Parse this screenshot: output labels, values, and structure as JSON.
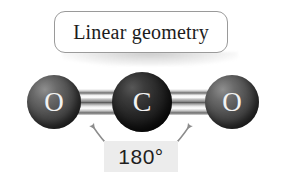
{
  "figure": {
    "title_label": "Linear geometry",
    "angle_label": "180°",
    "background_color": "#ffffff"
  },
  "callout": {
    "text": "Linear geometry",
    "border_color": "#9a9a9a",
    "fill_color": "#ffffff"
  },
  "molecule": {
    "name": "carbon-dioxide",
    "geometry": "linear",
    "bond_angle": "180°",
    "atoms": [
      {
        "symbol": "O",
        "role": "oxygen-left",
        "color": "#3a3a3a",
        "label_color": "#f2f2f2"
      },
      {
        "symbol": "C",
        "role": "carbon-center",
        "color": "#1a1a1a",
        "label_color": "#f2f2f2"
      },
      {
        "symbol": "O",
        "role": "oxygen-right",
        "color": "#3a3a3a",
        "label_color": "#f2f2f2"
      }
    ],
    "bonds": [
      {
        "name": "bond-left",
        "order": "double"
      },
      {
        "name": "bond-right",
        "order": "double"
      }
    ]
  },
  "annotation": {
    "angle_value": "180°",
    "box_color": "#ececec",
    "arrow_color": "#8c8c8c",
    "arrow_count": 2
  }
}
